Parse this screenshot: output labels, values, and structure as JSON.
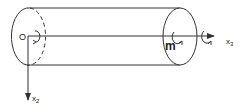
{
  "diagram": {
    "type": "cylinder-with-axes",
    "origin_label": "O",
    "axes": [
      {
        "id": "x2",
        "label": "x",
        "subscript": "2",
        "direction": "down"
      },
      {
        "id": "x3",
        "label": "x",
        "subscript": "3",
        "direction": "right"
      }
    ],
    "moment_label": "m",
    "colors": {
      "stroke": "#333333",
      "background": "#ffffff"
    }
  }
}
